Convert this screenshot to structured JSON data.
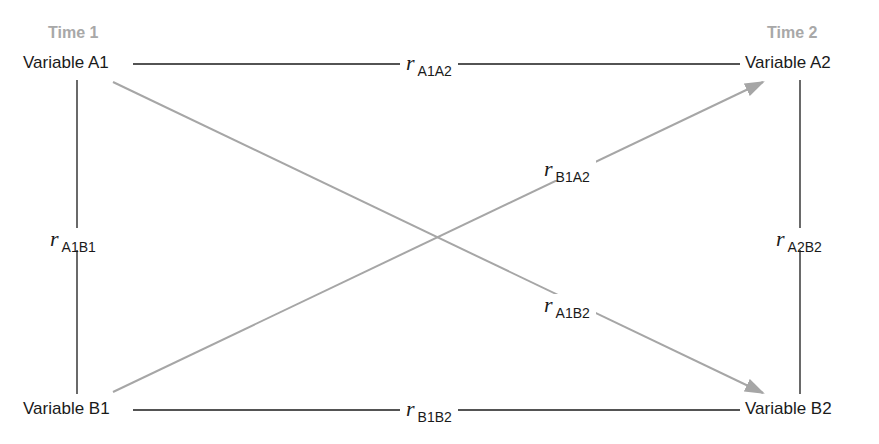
{
  "diagram": {
    "type": "cross-lagged panel correlation diagram",
    "time_labels": {
      "time1": "Time 1",
      "time2": "Time 2"
    },
    "variables": {
      "a1": "Variable A1",
      "a2": "Variable A2",
      "b1": "Variable B1",
      "b2": "Variable B2"
    },
    "correlations": {
      "a1a2": {
        "symbol": "r",
        "subscript": "A1A2",
        "from": "Variable A1",
        "to": "Variable A2",
        "style": "solid-black"
      },
      "b1b2": {
        "symbol": "r",
        "subscript": "B1B2",
        "from": "Variable B1",
        "to": "Variable B2",
        "style": "solid-black"
      },
      "a1b1": {
        "symbol": "r",
        "subscript": "A1B1",
        "from": "Variable A1",
        "to": "Variable B1",
        "style": "solid-black"
      },
      "a2b2": {
        "symbol": "r",
        "subscript": "A2B2",
        "from": "Variable A2",
        "to": "Variable B2",
        "style": "solid-black"
      },
      "b1a2": {
        "symbol": "r",
        "subscript": "B1A2",
        "from": "Variable B1",
        "to": "Variable A2",
        "style": "gray-arrow"
      },
      "a1b2": {
        "symbol": "r",
        "subscript": "A1B2",
        "from": "Variable A1",
        "to": "Variable B2",
        "style": "gray-arrow"
      }
    },
    "colors": {
      "line": "#1a1a1a",
      "arrow": "#a6a6a6",
      "time_label": "#a8a8a8"
    }
  }
}
